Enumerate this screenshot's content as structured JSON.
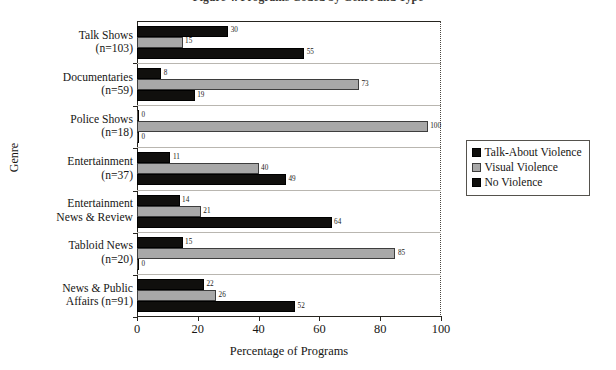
{
  "figure": {
    "title_visible_fragment": "Figure 4. Programs Coded by Genre and Type"
  },
  "legend": {
    "position": "right",
    "entries": [
      {
        "label": "Talk-About Violence",
        "swatch": "dark"
      },
      {
        "label": "Visual Violence",
        "swatch": "gray"
      },
      {
        "label": "No Violence",
        "swatch": "dark"
      }
    ]
  },
  "axes": {
    "x": {
      "title": "Percentage of Programs",
      "ticks": [
        "0",
        "20",
        "40",
        "60",
        "80",
        "100"
      ],
      "min": 0,
      "max": 100
    },
    "y": {
      "title": "Genre"
    }
  },
  "chart_data": {
    "type": "bar",
    "orientation": "horizontal",
    "xlabel": "Percentage of Programs",
    "ylabel": "Genre",
    "xlim": [
      0,
      100
    ],
    "grid": false,
    "legend_position": "right",
    "categories": [
      "Talk Shows (n=103)",
      "Documentaries (n=59)",
      "Police Shows (n=18)",
      "Entertainment (n=37)",
      "Entertainment News & Review",
      "Tabloid News (n=20)",
      "News & Public Affairs (n=91)"
    ],
    "category_lines": [
      [
        "Talk Shows",
        "(n=103)"
      ],
      [
        "Documentaries",
        "(n=59)"
      ],
      [
        "Police Shows",
        "(n=18)"
      ],
      [
        "Entertainment",
        "(n=37)"
      ],
      [
        "Entertainment",
        "News & Review"
      ],
      [
        "Tabloid News",
        "(n=20)"
      ],
      [
        "News & Public",
        "Affairs (n=91)"
      ]
    ],
    "series": [
      {
        "name": "Talk-About Violence",
        "color": "#100f0d",
        "values": [
          30,
          8,
          0,
          11,
          14,
          15,
          22
        ]
      },
      {
        "name": "Visual Violence",
        "color": "#a8a8a8",
        "values": [
          15,
          73,
          100,
          40,
          21,
          85,
          26
        ]
      },
      {
        "name": "No Violence",
        "color": "#100f0d",
        "values": [
          55,
          19,
          0,
          49,
          64,
          0,
          52
        ]
      }
    ]
  }
}
